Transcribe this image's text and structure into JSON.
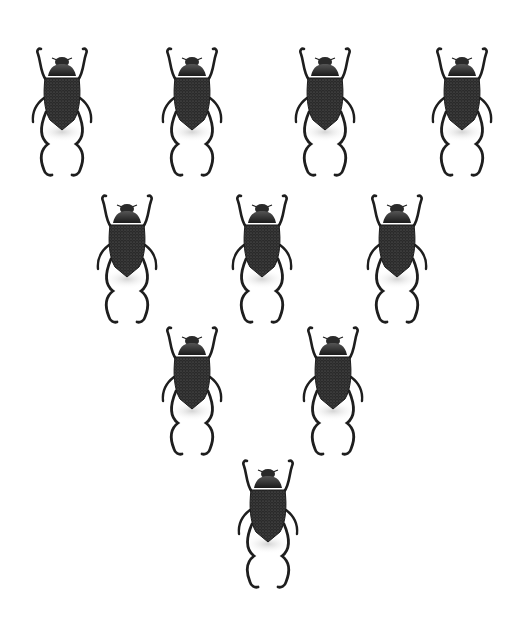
{
  "image": {
    "description": "Ten dark textured beetles arranged in an inverted triangle on a white background",
    "background": "#ffffff",
    "beetle_color": "#1e1e1e",
    "layout": "inverted-triangle",
    "rows": [
      {
        "count": 4,
        "centers_x": [
          62,
          192,
          325,
          462
        ],
        "top_y": 46
      },
      {
        "count": 3,
        "centers_x": [
          127,
          262,
          397
        ],
        "top_y": 193
      },
      {
        "count": 2,
        "centers_x": [
          192,
          333
        ],
        "top_y": 325
      },
      {
        "count": 1,
        "centers_x": [
          268
        ],
        "top_y": 458
      }
    ]
  }
}
